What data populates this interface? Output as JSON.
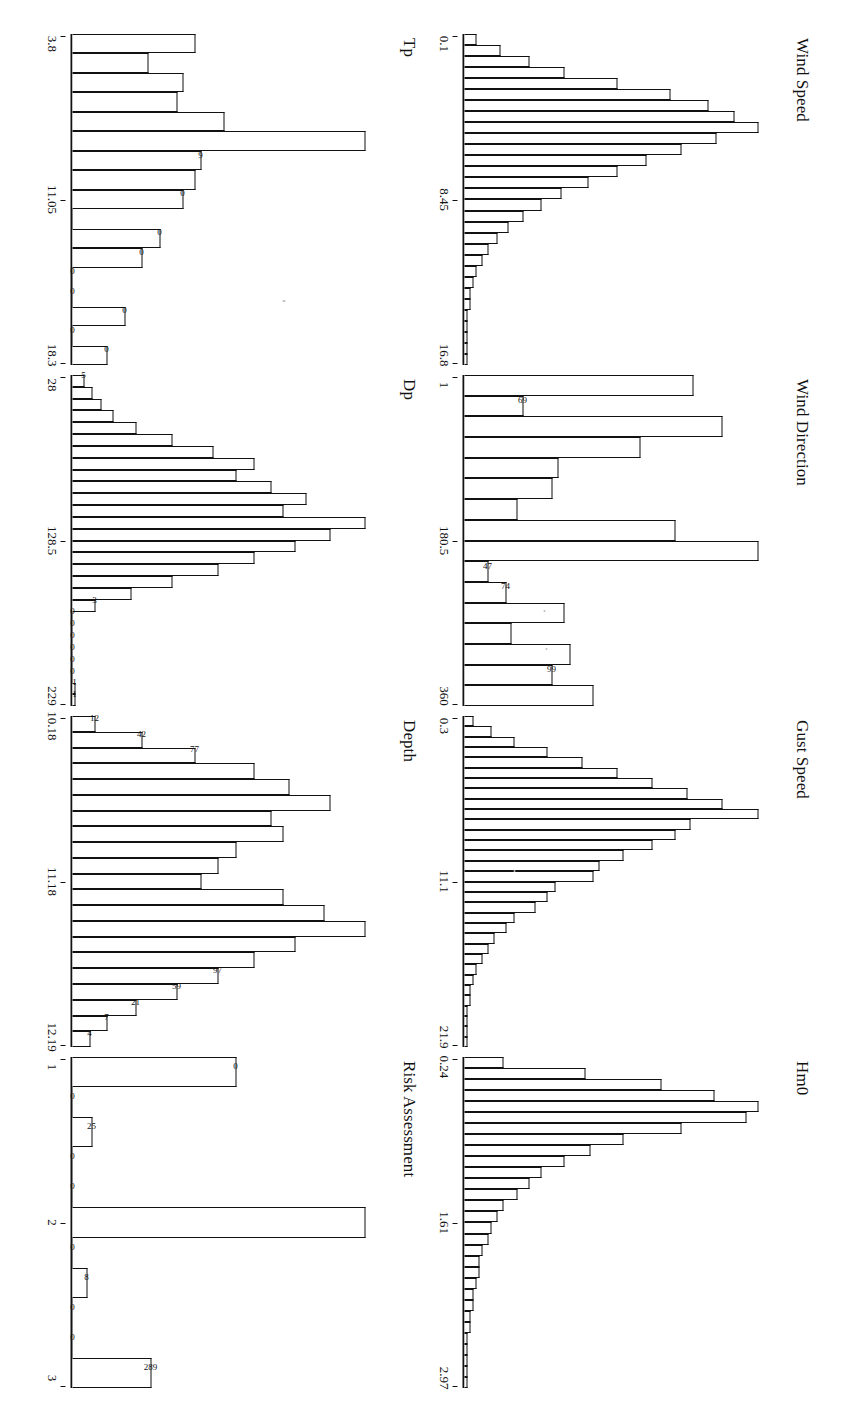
{
  "figure": {
    "orientation_note": "rotated",
    "panels": [
      {
        "title": "Wind Speed",
        "ticks": [
          "0.1",
          "8.45",
          "16.8"
        ],
        "labels": [
          "",
          "",
          "",
          "",
          "",
          "",
          "",
          "",
          "",
          "",
          "",
          "",
          "",
          "",
          "",
          "",
          "",
          "",
          "",
          "",
          "",
          "",
          "",
          "",
          "",
          "",
          "",
          "",
          "",
          ""
        ],
        "values": [
          4,
          12,
          22,
          34,
          52,
          70,
          83,
          92,
          100,
          86,
          74,
          62,
          52,
          42,
          33,
          26,
          20,
          15,
          11,
          8,
          6,
          4,
          3,
          2,
          2,
          1,
          1,
          1,
          1,
          1
        ]
      },
      {
        "title": "Wind Direction",
        "ticks": [
          "1",
          "180.5",
          "360"
        ],
        "labels": [
          "",
          "69",
          "",
          "",
          "",
          "",
          "",
          "",
          "",
          "47",
          "74",
          "",
          "",
          "",
          "99",
          ""
        ],
        "values": [
          78,
          20,
          88,
          60,
          32,
          30,
          18,
          72,
          100,
          8,
          14,
          34,
          16,
          36,
          30,
          44
        ]
      },
      {
        "title": "Gust Speed",
        "ticks": [
          "0.3",
          "11.1",
          "21.9"
        ],
        "labels": [
          "",
          "",
          "",
          "",
          "",
          "",
          "",
          "",
          "",
          "",
          "",
          "",
          "",
          "",
          "",
          "",
          "",
          "",
          "",
          "",
          "",
          "",
          "",
          "",
          "",
          "",
          "",
          "",
          "",
          "",
          "",
          ""
        ],
        "values": [
          3,
          9,
          17,
          28,
          40,
          52,
          64,
          76,
          88,
          100,
          77,
          72,
          64,
          54,
          46,
          44,
          31,
          28,
          24,
          17,
          14,
          10,
          8,
          6,
          4,
          3,
          2,
          2,
          1,
          1,
          1,
          1
        ]
      },
      {
        "title": "Hm0",
        "ticks": [
          "0.24",
          "1.61",
          "2.97"
        ],
        "labels": [
          "",
          "",
          "",
          "",
          "",
          "",
          "",
          "",
          "",
          "",
          "",
          "",
          "",
          "",
          "",
          "",
          "",
          "",
          "",
          "",
          "",
          "",
          "",
          "",
          "",
          "",
          "",
          "",
          "",
          ""
        ],
        "values": [
          13,
          41,
          67,
          85,
          100,
          96,
          74,
          54,
          43,
          34,
          26,
          22,
          18,
          13,
          11,
          9,
          8,
          6,
          5,
          5,
          4,
          3,
          3,
          2,
          2,
          1,
          1,
          1,
          1,
          1
        ]
      },
      {
        "title": "Tp",
        "ticks": [
          "3.8",
          "11.05",
          "18.3"
        ],
        "labels": [
          "",
          "",
          "",
          "",
          "",
          "",
          "9",
          "",
          "0",
          "",
          "0",
          "0",
          "0",
          "0",
          "0",
          "0",
          "0"
        ],
        "values": [
          42,
          26,
          38,
          36,
          52,
          100,
          44,
          42,
          38,
          0,
          30,
          24,
          0,
          0,
          18,
          0,
          12
        ],
        "zero_flags": [
          false,
          false,
          false,
          false,
          false,
          false,
          false,
          false,
          false,
          true,
          false,
          false,
          true,
          true,
          false,
          true,
          false
        ]
      },
      {
        "title": "Dp",
        "ticks": [
          "28",
          "128.5",
          "229"
        ],
        "labels": [
          "5",
          "",
          "",
          "",
          "",
          "",
          "",
          "",
          "",
          "",
          "",
          "",
          "",
          "",
          "",
          "",
          "",
          "",
          "",
          "3",
          "0",
          "0",
          "0",
          "0",
          "0",
          "0",
          "1",
          "1"
        ],
        "values": [
          4,
          7,
          10,
          14,
          22,
          34,
          48,
          62,
          56,
          68,
          80,
          72,
          100,
          88,
          76,
          62,
          50,
          34,
          20,
          8,
          0,
          0,
          0,
          0,
          0,
          0,
          1,
          1
        ],
        "zero_flags": [
          false,
          false,
          false,
          false,
          false,
          false,
          false,
          false,
          false,
          false,
          false,
          false,
          false,
          false,
          false,
          false,
          false,
          false,
          false,
          false,
          true,
          true,
          true,
          true,
          true,
          true,
          false,
          false
        ]
      },
      {
        "title": "Depth",
        "ticks": [
          "10.18",
          "11.18",
          "12.19"
        ],
        "labels": [
          "12",
          "42",
          "77",
          "",
          "",
          "",
          "",
          "",
          "",
          "",
          "",
          "",
          "",
          "",
          "",
          "",
          "97",
          "59",
          "21",
          "7",
          "4"
        ],
        "values": [
          8,
          24,
          42,
          62,
          74,
          88,
          68,
          72,
          56,
          50,
          44,
          72,
          86,
          100,
          76,
          62,
          50,
          36,
          22,
          12,
          6
        ]
      },
      {
        "title": "Risk Assessment",
        "ticks": [
          "1",
          "2",
          "3"
        ],
        "labels": [
          "0",
          "0",
          "25",
          "0",
          "0",
          "",
          "0",
          "8",
          "0",
          "0",
          "289"
        ],
        "values": [
          56,
          0,
          7,
          0,
          0,
          100,
          0,
          5,
          0,
          0,
          27
        ],
        "zero_flags": [
          false,
          true,
          false,
          true,
          true,
          false,
          true,
          false,
          true,
          true,
          false
        ]
      }
    ]
  }
}
